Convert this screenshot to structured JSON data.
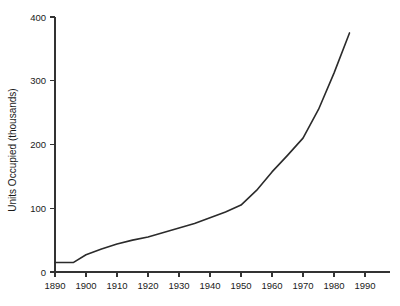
{
  "chart_data": {
    "type": "line",
    "title": "",
    "subtitle": "",
    "xlabel": "",
    "ylabel": "Units Occupied (thousands)",
    "xlim": [
      1890,
      1990
    ],
    "ylim": [
      0,
      400
    ],
    "xticks": [
      1890,
      1900,
      1910,
      1920,
      1930,
      1940,
      1950,
      1960,
      1970,
      1980,
      1990
    ],
    "xtick_labels": [
      "1890",
      "1900",
      "1910",
      "1920",
      "1930",
      "1940",
      "1950",
      "1960",
      "1970",
      "1980",
      "1990"
    ],
    "yticks": [
      0,
      100,
      200,
      300,
      400
    ],
    "ytick_labels": [
      "0",
      "100",
      "200",
      "300",
      "400"
    ],
    "grid": false,
    "legend": null,
    "series": [
      {
        "name": "Units Occupied",
        "color": "#2b2b2b",
        "x": [
          1890,
          1896,
          1900,
          1905,
          1910,
          1915,
          1920,
          1925,
          1930,
          1935,
          1940,
          1945,
          1950,
          1955,
          1960,
          1965,
          1970,
          1975,
          1980,
          1985
        ],
        "y": [
          15,
          15,
          27,
          36,
          44,
          50,
          55,
          62,
          69,
          76,
          85,
          94,
          105,
          128,
          157,
          183,
          210,
          255,
          312,
          375
        ]
      }
    ],
    "annotations": []
  },
  "figure": {
    "background_color": "#ffffff",
    "axis_color": "#333333",
    "text_color": "#1a1a1a"
  }
}
